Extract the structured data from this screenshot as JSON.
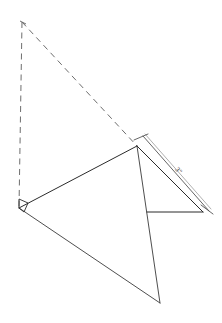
{
  "figure": {
    "background_color": "#ffffff",
    "line_color": "#3a3a3a",
    "hidden_line_color": "#6e6e6e",
    "dimension_color": "#4a4a4a"
  },
  "dimension": {
    "label": "3\"",
    "value": 3,
    "unit": "inches",
    "placement": "along-right-hypotenuse"
  },
  "vertices": {
    "dashed_apex": {
      "x": 22,
      "y": 22
    },
    "left_vertex": {
      "x": 19,
      "y": 208
    },
    "top_apex": {
      "x": 137,
      "y": 146
    },
    "bottom_vertex": {
      "x": 160,
      "y": 303
    },
    "right_vertex": {
      "x": 203,
      "y": 212
    },
    "base_left": {
      "x": 147,
      "y": 212
    }
  },
  "markers": {
    "right_angle_at": "left_vertex"
  },
  "elements": {
    "dashed_vertical_label": "hidden vertical edge",
    "dashed_diagonal_label": "hidden slant edge",
    "upper_left_edge_label": "upper left edge",
    "lower_left_edge_label": "lower left edge",
    "central_vertical_edge_label": "central vertical edge",
    "right_hypotenuse_label": "right hypotenuse",
    "right_base_label": "right base"
  }
}
